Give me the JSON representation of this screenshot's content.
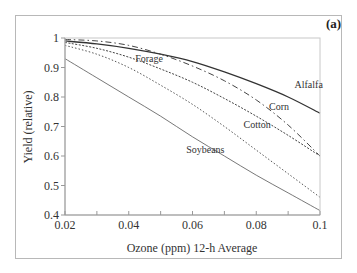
{
  "panel_label": "(a)",
  "chart_data": {
    "type": "line",
    "title": "",
    "panel": "(a)",
    "xlabel": "Ozone (ppm) 12-h Average",
    "ylabel": "Yield (relative)",
    "xlim": [
      0.02,
      0.1
    ],
    "ylim": [
      0.4,
      1.0
    ],
    "xticks": [
      0.02,
      0.04,
      0.06,
      0.08,
      0.1
    ],
    "xtick_labels": [
      "0.02",
      "0.04",
      "0.06",
      "0.08",
      "0.1"
    ],
    "yticks": [
      0.4,
      0.5,
      0.6,
      0.7,
      0.8,
      0.9,
      1.0
    ],
    "ytick_labels": [
      "0.4",
      "0.5",
      "0.6",
      "0.7",
      "0.8",
      "0.9",
      "1"
    ],
    "grid": false,
    "legend": "inline labels",
    "x": [
      0.02,
      0.03,
      0.04,
      0.05,
      0.06,
      0.07,
      0.08,
      0.09,
      0.1
    ],
    "series": [
      {
        "name": "Alfalfa",
        "style": "solid",
        "values": [
          0.99,
          0.98,
          0.965,
          0.945,
          0.92,
          0.885,
          0.845,
          0.8,
          0.745
        ]
      },
      {
        "name": "Corn",
        "style": "dash-dot",
        "values": [
          0.995,
          0.99,
          0.975,
          0.945,
          0.905,
          0.855,
          0.79,
          0.705,
          0.6
        ]
      },
      {
        "name": "Forage",
        "style": "dashed",
        "values": [
          0.985,
          0.965,
          0.935,
          0.895,
          0.85,
          0.795,
          0.735,
          0.67,
          0.6
        ]
      },
      {
        "name": "Cotton",
        "style": "dotted",
        "values": [
          0.975,
          0.945,
          0.9,
          0.84,
          0.775,
          0.7,
          0.62,
          0.54,
          0.46
        ]
      },
      {
        "name": "Soybeans",
        "style": "thin-solid",
        "values": [
          0.93,
          0.865,
          0.8,
          0.735,
          0.665,
          0.6,
          0.535,
          0.475,
          0.415
        ]
      }
    ],
    "annotations": [
      {
        "text": "Forage",
        "x": 0.042,
        "y": 0.92
      },
      {
        "text": "Alfalfa",
        "x": 0.092,
        "y": 0.83
      },
      {
        "text": "Corn",
        "x": 0.084,
        "y": 0.755
      },
      {
        "text": "Cotton",
        "x": 0.076,
        "y": 0.695
      },
      {
        "text": "Soybeans",
        "x": 0.058,
        "y": 0.61
      }
    ]
  }
}
